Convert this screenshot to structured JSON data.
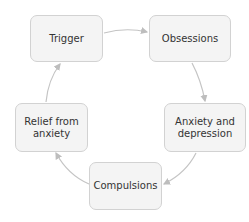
{
  "diagram": {
    "type": "cycle",
    "colors": {
      "box_fill": "#f4f4f4",
      "box_border": "#d2d2d2",
      "arrow": "#bdbdbd",
      "text": "#333333"
    },
    "nodes": [
      {
        "id": "trigger",
        "label": "Trigger"
      },
      {
        "id": "obsessions",
        "label": "Obsessions"
      },
      {
        "id": "anxiety",
        "label": "Anxiety and depression"
      },
      {
        "id": "compulsions",
        "label": "Compulsions"
      },
      {
        "id": "relief",
        "label": "Relief from anxiety"
      }
    ],
    "edges": [
      {
        "from": "trigger",
        "to": "obsessions"
      },
      {
        "from": "obsessions",
        "to": "anxiety"
      },
      {
        "from": "anxiety",
        "to": "compulsions"
      },
      {
        "from": "compulsions",
        "to": "relief"
      },
      {
        "from": "relief",
        "to": "trigger"
      }
    ]
  }
}
